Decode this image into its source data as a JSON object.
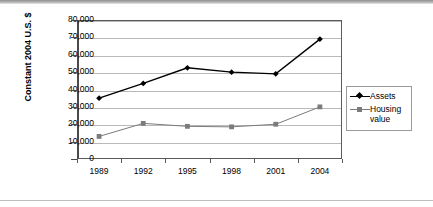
{
  "chart_data": {
    "type": "line",
    "title": "",
    "xlabel": "",
    "ylabel": "Constant 2004 U.S. $",
    "categories": [
      "1989",
      "1992",
      "1995",
      "1998",
      "2001",
      "2004"
    ],
    "ylim": [
      0,
      80000
    ],
    "ytick_values": [
      0,
      10000,
      20000,
      30000,
      40000,
      50000,
      60000,
      70000,
      80000
    ],
    "ytick_labels": [
      "0",
      "10,000",
      "20,000",
      "30,000",
      "40,000",
      "50,000",
      "60,000",
      "70,000",
      "80,000"
    ],
    "grid": true,
    "legend_position": "right",
    "series": [
      {
        "name": "Assets",
        "color": "#000000",
        "marker": "diamond",
        "values": [
          35000,
          43500,
          52500,
          50000,
          49000,
          69000
        ]
      },
      {
        "name": "Housing value",
        "color": "#7b7b7b",
        "marker": "square",
        "values": [
          13000,
          20500,
          18800,
          18500,
          20000,
          30000
        ]
      }
    ]
  },
  "legend": {
    "items": [
      {
        "label": "Assets"
      },
      {
        "label_line1": "Housing",
        "label_line2": "value"
      }
    ]
  },
  "colors": {
    "assets": "#000000",
    "housing": "#7b7b7b",
    "gridline": "#b9b9b9",
    "axis": "#4a4a4a",
    "plot_border": "#5a5a5a",
    "background": "#ffffff"
  }
}
